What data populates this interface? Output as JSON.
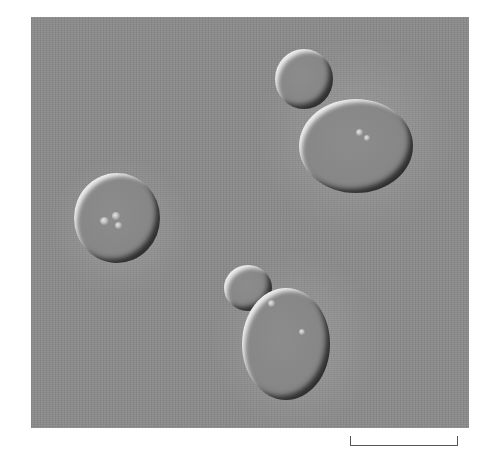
{
  "figure": {
    "type": "DIC micrograph",
    "background_color": "#8a8a8a",
    "cells": [
      {
        "name": "single-cell-left",
        "cx": 116,
        "cy": 217,
        "rx": 42,
        "ry": 44,
        "inclusions": 3
      },
      {
        "name": "bud-top-right",
        "cx": 303,
        "cy": 79,
        "rx": 29,
        "ry": 30
      },
      {
        "name": "mother-cell-top-right",
        "cx": 357,
        "cy": 145,
        "rx": 57,
        "ry": 46,
        "inclusions": 2
      },
      {
        "name": "bud-bottom",
        "cx": 248,
        "cy": 285,
        "rx": 24,
        "ry": 23
      },
      {
        "name": "mother-cell-bottom",
        "cx": 286,
        "cy": 344,
        "rx": 44,
        "ry": 56,
        "inclusions": 2
      }
    ]
  },
  "scale_bar": {
    "label": "",
    "x_start": 350,
    "x_end": 458,
    "y": 446
  }
}
